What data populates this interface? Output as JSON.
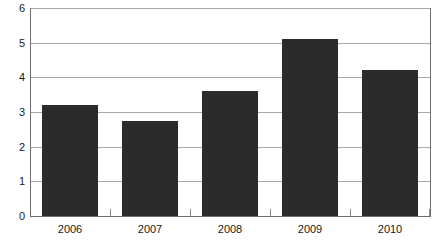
{
  "chart_data": {
    "type": "bar",
    "title": "",
    "subtitle": "",
    "xlabel": "",
    "ylabel": "",
    "categories": [
      "2006",
      "2007",
      "2008",
      "2009",
      "2010"
    ],
    "values": [
      3.2,
      2.75,
      3.6,
      5.1,
      4.2
    ],
    "ylim": [
      0,
      6
    ],
    "yticks": [
      "0",
      "1",
      "2",
      "3",
      "4",
      "5",
      "6"
    ],
    "ytick_values": [
      0,
      1,
      2,
      3,
      4,
      5,
      6
    ],
    "grid": true,
    "grid_axis": "y",
    "legend": false,
    "legend_position": "none",
    "annotations": [],
    "colors": {
      "bar_fill": "#2b2b2b",
      "gridline": "#a8a8a8",
      "axis_line": "#6e6e6e",
      "tick_mark": "#8c8c8c",
      "text": "#1a1a1a",
      "plot_background": "#ffffff"
    }
  }
}
